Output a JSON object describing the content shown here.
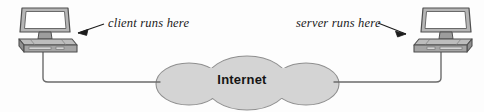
{
  "diagram": {
    "background_color": "#fdfdfd",
    "cloud": {
      "label": "Internet",
      "fill_color": "#d4d4d4",
      "stroke_color": "#8a8a8a",
      "text_color": "#151515"
    },
    "annotations": [
      {
        "id": "client",
        "text": "client runs here",
        "arrow_direction": "down-left",
        "points_to": "client-computer"
      },
      {
        "id": "server",
        "text": "server runs here",
        "arrow_direction": "down-right",
        "points_to": "server-computer"
      }
    ],
    "nodes": [
      {
        "id": "client-computer",
        "role": "client",
        "icon": "desktop-computer-icon",
        "screen_color": "#ffffff",
        "case_color": "#a8a8a8",
        "outline_color": "#555555"
      },
      {
        "id": "server-computer",
        "role": "server",
        "icon": "desktop-computer-icon",
        "screen_color": "#ffffff",
        "case_color": "#a8a8a8",
        "outline_color": "#555555"
      }
    ],
    "links": [
      {
        "from": "client-computer",
        "to": "cloud",
        "style": "elbow-line",
        "color": "#6b6b6b"
      },
      {
        "from": "server-computer",
        "to": "cloud",
        "style": "elbow-line",
        "color": "#6b6b6b"
      }
    ]
  }
}
